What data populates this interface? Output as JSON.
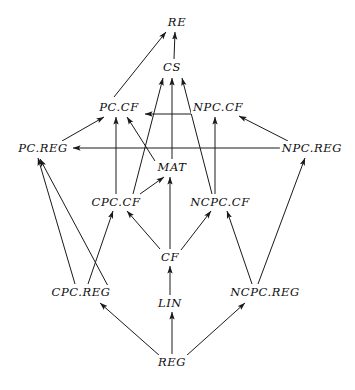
{
  "diagram": {
    "title": "",
    "type": "directed-graph",
    "stroke_color": "#1a1a1a",
    "text_color": "#0d0d0d",
    "background_color": "#ffffff",
    "nodes": [
      {
        "id": "RE",
        "label": "RE",
        "x": 177,
        "y": 22,
        "w": 26,
        "h": 14
      },
      {
        "id": "CS",
        "label": "CS",
        "x": 172,
        "y": 67,
        "w": 26,
        "h": 14
      },
      {
        "id": "PC.CF",
        "label": "PC.CF",
        "x": 119,
        "y": 107,
        "w": 44,
        "h": 14
      },
      {
        "id": "NPC.CF",
        "label": "NPC.CF",
        "x": 218,
        "y": 107,
        "w": 52,
        "h": 14
      },
      {
        "id": "PC.REG",
        "label": "PC.REG",
        "x": 43,
        "y": 148,
        "w": 52,
        "h": 14
      },
      {
        "id": "NPC.REG",
        "label": "NPC.REG",
        "x": 312,
        "y": 148,
        "w": 60,
        "h": 14
      },
      {
        "id": "MAT",
        "label": "MAT",
        "x": 172,
        "y": 167,
        "w": 34,
        "h": 14
      },
      {
        "id": "CPC.CF",
        "label": "CPC.CF",
        "x": 116,
        "y": 202,
        "w": 50,
        "h": 14
      },
      {
        "id": "NCPC.CF",
        "label": "NCPC.CF",
        "x": 220,
        "y": 202,
        "w": 58,
        "h": 14
      },
      {
        "id": "CF",
        "label": "CF",
        "x": 170,
        "y": 257,
        "w": 24,
        "h": 14
      },
      {
        "id": "CPC.REG",
        "label": "CPC.REG",
        "x": 81,
        "y": 292,
        "w": 62,
        "h": 14
      },
      {
        "id": "NCPC.REG",
        "label": "NCPC.REG",
        "x": 265,
        "y": 292,
        "w": 70,
        "h": 14
      },
      {
        "id": "LIN",
        "label": "LIN",
        "x": 170,
        "y": 303,
        "w": 30,
        "h": 14
      },
      {
        "id": "REG",
        "label": "REG",
        "x": 172,
        "y": 362,
        "w": 32,
        "h": 14
      }
    ],
    "edges": [
      {
        "from": "PC.CF",
        "to": "RE",
        "x1": 114,
        "y1": 97,
        "x2": 166,
        "y2": 32
      },
      {
        "from": "CS",
        "to": "RE",
        "x1": 174,
        "y1": 59,
        "x2": 175,
        "y2": 32
      },
      {
        "from": "CPC.CF",
        "to": "CS",
        "x1": 133,
        "y1": 194,
        "x2": 163,
        "y2": 78
      },
      {
        "from": "MAT",
        "to": "CS",
        "x1": 172,
        "y1": 159,
        "x2": 172,
        "y2": 78
      },
      {
        "from": "NCPC.CF",
        "to": "CS",
        "x1": 212,
        "y1": 194,
        "x2": 182,
        "y2": 78
      },
      {
        "from": "NPC.CF",
        "to": "PC.CF",
        "x1": 192,
        "y1": 114,
        "x2": 145,
        "y2": 114
      },
      {
        "from": "PC.REG",
        "to": "PC.CF",
        "x1": 62,
        "y1": 141,
        "x2": 104,
        "y2": 117
      },
      {
        "from": "CPC.CF",
        "to": "PC.CF",
        "x1": 116,
        "y1": 194,
        "x2": 116,
        "y2": 117
      },
      {
        "from": "MAT",
        "to": "PC.CF",
        "x1": 155,
        "y1": 161,
        "x2": 127,
        "y2": 117
      },
      {
        "from": "NPC.REG",
        "to": "NPC.CF",
        "x1": 288,
        "y1": 141,
        "x2": 239,
        "y2": 116
      },
      {
        "from": "NCPC.CF",
        "to": "NPC.CF",
        "x1": 215,
        "y1": 194,
        "x2": 215,
        "y2": 117
      },
      {
        "from": "NPC.REG",
        "to": "PC.REG",
        "x1": 281,
        "y1": 148,
        "x2": 73,
        "y2": 148
      },
      {
        "from": "CPC.REG",
        "to": "PC.REG",
        "x1": 75,
        "y1": 284,
        "x2": 38,
        "y2": 158
      },
      {
        "from": "LIN",
        "to": "PC.REG",
        "x1": 108,
        "y1": 286,
        "x2": 40,
        "y2": 159
      },
      {
        "from": "CPC.CF",
        "to": "MAT",
        "x1": 140,
        "y1": 194,
        "x2": 164,
        "y2": 177
      },
      {
        "from": "CF",
        "to": "MAT",
        "x1": 170,
        "y1": 249,
        "x2": 170,
        "y2": 177
      },
      {
        "from": "CPC.REG",
        "to": "CPC.CF",
        "x1": 88,
        "y1": 284,
        "x2": 113,
        "y2": 211
      },
      {
        "from": "CF",
        "to": "CPC.CF",
        "x1": 160,
        "y1": 249,
        "x2": 127,
        "y2": 211
      },
      {
        "from": "NCPC.REG",
        "to": "NCPC.CF",
        "x1": 252,
        "y1": 284,
        "x2": 227,
        "y2": 211
      },
      {
        "from": "CF",
        "to": "NCPC.CF",
        "x1": 181,
        "y1": 250,
        "x2": 211,
        "y2": 211
      },
      {
        "from": "LIN",
        "to": "CF",
        "x1": 170,
        "y1": 295,
        "x2": 170,
        "y2": 266
      },
      {
        "from": "NCPC.REG",
        "to": "NPC.REG",
        "x1": 258,
        "y1": 284,
        "x2": 305,
        "y2": 158
      },
      {
        "from": "REG",
        "to": "CPC.REG",
        "x1": 160,
        "y1": 356,
        "x2": 100,
        "y2": 303
      },
      {
        "from": "REG",
        "to": "LIN",
        "x1": 172,
        "y1": 354,
        "x2": 172,
        "y2": 312
      },
      {
        "from": "REG",
        "to": "NCPC.REG",
        "x1": 186,
        "y1": 356,
        "x2": 245,
        "y2": 303
      }
    ]
  }
}
